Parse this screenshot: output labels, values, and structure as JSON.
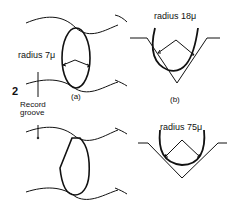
{
  "figure": {
    "number": "2",
    "groove_label_line1": "Record",
    "groove_label_line2": "groove",
    "panels": [
      {
        "id": "a",
        "caption": "(a)",
        "stylus": "elliptical",
        "radius_label": "radius 7μ"
      },
      {
        "id": "b",
        "caption": "(b)",
        "stylus": "conical",
        "radius_label": "radius 18μ"
      },
      {
        "id": "c",
        "caption": "",
        "stylus": "worn",
        "radius_label": "radius 75μ"
      }
    ],
    "stroke_color": "#111111"
  }
}
